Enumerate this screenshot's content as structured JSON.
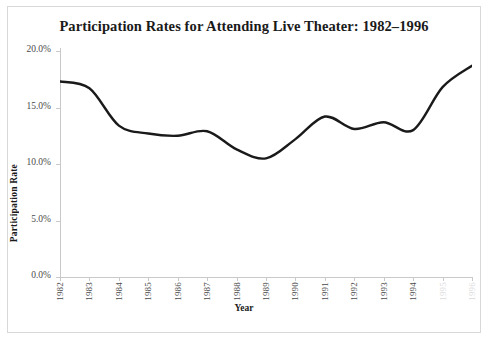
{
  "chart_data": {
    "type": "line",
    "title": "Participation Rates for Attending Live Theater: 1982–1996",
    "xlabel": "Year",
    "ylabel": "Participation Rate",
    "ylim": [
      0,
      20
    ],
    "ytick_labels": [
      "20.0%",
      "15.0%",
      "10.0%",
      "5.0%",
      "0.0%"
    ],
    "ytick_values": [
      20,
      15,
      10,
      5,
      0
    ],
    "grid": false,
    "legend": "none",
    "categories": [
      "1982",
      "1983",
      "1984",
      "1985",
      "1986",
      "1987",
      "1988",
      "1989",
      "1990",
      "1991",
      "1992",
      "1993",
      "1994",
      "1995",
      "1996"
    ],
    "xtick_labels_visible": [
      "1982",
      "1983",
      "1984",
      "1985",
      "1986",
      "1987",
      "1988",
      "1989",
      "1990",
      "1991",
      "1992",
      "1993",
      "1994"
    ],
    "xtick_labels_faded": [
      "1995",
      "1996"
    ],
    "series": [
      {
        "name": "Participation Rate",
        "color": "#1a1a1a",
        "values": [
          17.3,
          16.7,
          13.4,
          12.7,
          12.5,
          12.9,
          11.3,
          10.5,
          12.2,
          14.2,
          13.1,
          13.7,
          13.0,
          16.8,
          18.7
        ]
      }
    ]
  },
  "axes": {
    "y_ticks": [
      {
        "label": "20.0%",
        "value": 20
      },
      {
        "label": "15.0%",
        "value": 15
      },
      {
        "label": "10.0%",
        "value": 10
      },
      {
        "label": "5.0%",
        "value": 5
      },
      {
        "label": "0.0%",
        "value": 0
      }
    ]
  },
  "caption": {
    "text": ""
  },
  "colors": {
    "line": "#1a1a1a",
    "axis": "#c9c9c9",
    "frame": "#d8d8d8",
    "text": "#1a1a1a",
    "tick_text": "#4a4a4a"
  }
}
